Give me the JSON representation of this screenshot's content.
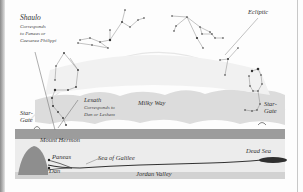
{
  "diagram": {
    "labels": {
      "shaulo": {
        "title": "Shaulo",
        "line1": "Corresponds",
        "line2": "to Paneas or",
        "line3": "Caesarea Philippi"
      },
      "ecliptic": "Ecliptic",
      "lesath": {
        "title": "Lesath",
        "line1": "Corresponds to",
        "line2": "Dan or Leshem"
      },
      "milky_way": "Milky Way",
      "star_gate_left": {
        "line1": "Star-",
        "line2": "Gate"
      },
      "star_gate_right": {
        "line1": "Star-",
        "line2": "Gate"
      },
      "mount_hermon": "Mount Hermon",
      "paneas": "Paneas",
      "dan": "Dan",
      "sea_of_galilee": "Sea of Galilee",
      "dead_sea": "Dead Sea",
      "jordan_valley": "Jordan Valley"
    },
    "colors": {
      "sky": "#fdfdfd",
      "milky_way": "#d9d9d9",
      "ground": "#a9a9a9",
      "ground_light": "#e2e2e2",
      "mountain": "#8f8f8f",
      "river": "#333333",
      "text": "#333333"
    }
  }
}
